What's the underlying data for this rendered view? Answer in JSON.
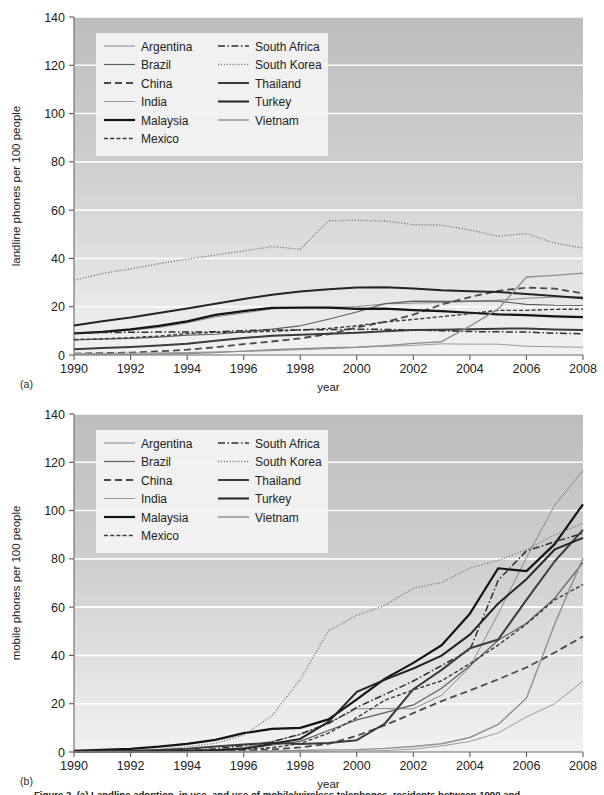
{
  "figure": {
    "panel_a_tag": "(a)",
    "panel_b_tag": "(b)",
    "caption": "Figure 2.  (a) Landline adoption, in use, and use of mobile/wireless telephones, residents between 1990 and"
  },
  "legend": {
    "entries": [
      {
        "label": "Argentina",
        "style": "solid",
        "width": 1.0,
        "color": "#8a8a8a"
      },
      {
        "label": "Brazil",
        "style": "solid",
        "width": 1.2,
        "color": "#5e5e5e"
      },
      {
        "label": "China",
        "style": "dashed",
        "width": 1.8,
        "color": "#4a4a4a"
      },
      {
        "label": "India",
        "style": "solid",
        "width": 1.0,
        "color": "#9a9a9a"
      },
      {
        "label": "Malaysia",
        "style": "solid",
        "width": 2.2,
        "color": "#141414"
      },
      {
        "label": "Mexico",
        "style": "dotted-dash",
        "width": 1.4,
        "color": "#3a3a3a"
      },
      {
        "label": "South Africa",
        "style": "dashdot",
        "width": 1.5,
        "color": "#2e2e2e"
      },
      {
        "label": "South Korea",
        "style": "dotted",
        "width": 1.3,
        "color": "#7a7a7a"
      },
      {
        "label": "Thailand",
        "style": "solid",
        "width": 2.0,
        "color": "#3b3b3b"
      },
      {
        "label": "Turkey",
        "style": "solid",
        "width": 2.0,
        "color": "#242424"
      },
      {
        "label": "Vietnam",
        "style": "solid",
        "width": 1.4,
        "color": "#8f8f8f"
      }
    ]
  },
  "chart_data": [
    {
      "type": "line",
      "panel": "a",
      "title": "",
      "xlabel": "year",
      "ylabel": "landline phones per 100 people",
      "xlim": [
        1990,
        2008
      ],
      "ylim": [
        0,
        140
      ],
      "xticks": [
        1990,
        1992,
        1994,
        1996,
        1998,
        2000,
        2002,
        2004,
        2006,
        2008
      ],
      "yticks": [
        0,
        20,
        40,
        60,
        80,
        100,
        120,
        140
      ],
      "grid": "horizontal-white",
      "legend_position": "upper-left-inside",
      "x": [
        1990,
        1991,
        1992,
        1993,
        1994,
        1995,
        1996,
        1997,
        1998,
        1999,
        2000,
        2001,
        2002,
        2003,
        2004,
        2005,
        2006,
        2007,
        2008
      ],
      "series": [
        {
          "name": "Argentina",
          "values": [
            9.3,
            9.6,
            10.3,
            11.4,
            13.3,
            15.8,
            17.4,
            19.1,
            19.7,
            19.8,
            20.0,
            21.2,
            21.5,
            21.7,
            22.2,
            22.7,
            23.5,
            24.0,
            24.2
          ]
        },
        {
          "name": "Brazil",
          "values": [
            6.3,
            6.6,
            6.9,
            7.4,
            8.2,
            8.6,
            9.6,
            10.7,
            12.1,
            14.8,
            17.8,
            21.3,
            22.3,
            22.2,
            22.3,
            22.3,
            21.0,
            20.6,
            20.5
          ]
        },
        {
          "name": "China",
          "values": [
            0.6,
            0.8,
            1.0,
            1.5,
            2.2,
            3.2,
            4.5,
            5.6,
            6.9,
            8.6,
            11.4,
            13.7,
            16.7,
            20.9,
            24.0,
            26.6,
            27.9,
            27.5,
            25.5
          ]
        },
        {
          "name": "India",
          "values": [
            0.6,
            0.7,
            0.8,
            0.9,
            1.0,
            1.3,
            1.5,
            1.8,
            2.2,
            2.6,
            3.2,
            3.6,
            4.0,
            4.6,
            4.5,
            4.5,
            3.6,
            3.4,
            3.2
          ]
        },
        {
          "name": "Malaysia",
          "values": [
            8.9,
            9.6,
            10.6,
            12.1,
            13.9,
            16.6,
            18.2,
            19.5,
            19.6,
            19.6,
            19.1,
            19.2,
            18.6,
            18.2,
            17.5,
            16.8,
            16.5,
            16.0,
            15.7
          ]
        },
        {
          "name": "Mexico",
          "values": [
            6.4,
            6.7,
            7.2,
            7.8,
            8.9,
            9.4,
            9.4,
            9.8,
            10.4,
            11.0,
            12.1,
            13.7,
            14.7,
            15.9,
            17.1,
            18.5,
            18.5,
            18.9,
            19.0
          ]
        },
        {
          "name": "South Africa",
          "values": [
            9.0,
            9.3,
            9.4,
            9.5,
            9.5,
            9.6,
            10.1,
            10.4,
            10.4,
            10.5,
            10.7,
            10.6,
            10.4,
            10.0,
            9.7,
            9.6,
            9.5,
            9.0,
            8.8
          ]
        },
        {
          "name": "South Korea",
          "values": [
            31.0,
            33.7,
            35.7,
            37.8,
            39.7,
            41.4,
            43.1,
            44.9,
            43.8,
            55.6,
            55.8,
            55.5,
            54.0,
            53.8,
            51.8,
            49.2,
            50.3,
            46.3,
            44.3
          ]
        },
        {
          "name": "Thailand",
          "values": [
            2.4,
            2.9,
            3.3,
            3.9,
            4.7,
            5.9,
            7.0,
            8.0,
            8.4,
            8.8,
            9.2,
            9.8,
            10.4,
            10.5,
            10.7,
            10.9,
            11.0,
            10.6,
            10.4
          ]
        },
        {
          "name": "Turkey",
          "values": [
            12.2,
            14.0,
            15.5,
            17.4,
            19.3,
            21.2,
            23.2,
            25.0,
            26.3,
            27.2,
            28.0,
            28.1,
            27.5,
            26.8,
            26.4,
            26.1,
            25.3,
            24.4,
            23.5
          ]
        },
        {
          "name": "Vietnam",
          "values": [
            0.15,
            0.2,
            0.25,
            0.4,
            0.6,
            1.0,
            1.6,
            2.2,
            2.6,
            3.0,
            3.2,
            3.9,
            4.8,
            5.5,
            12.0,
            19.0,
            32.3,
            33.0,
            33.9
          ]
        }
      ]
    },
    {
      "type": "line",
      "panel": "b",
      "title": "",
      "xlabel": "year",
      "ylabel": "mobile phones per 100 people",
      "xlim": [
        1990,
        2008
      ],
      "ylim": [
        0,
        140
      ],
      "xticks": [
        1990,
        1992,
        1994,
        1996,
        1998,
        2000,
        2002,
        2004,
        2006,
        2008
      ],
      "yticks": [
        0,
        20,
        40,
        60,
        80,
        100,
        120,
        140
      ],
      "grid": "horizontal-white",
      "legend_position": "upper-left-inside",
      "x": [
        1990,
        1991,
        1992,
        1993,
        1994,
        1995,
        1996,
        1997,
        1998,
        1999,
        2000,
        2001,
        2002,
        2003,
        2004,
        2005,
        2006,
        2007,
        2008
      ],
      "series": [
        {
          "name": "Argentina",
          "values": [
            0.0,
            0.1,
            0.2,
            0.4,
            0.8,
            1.0,
            1.8,
            4.3,
            7.2,
            12.0,
            17.9,
            18.0,
            17.9,
            23.5,
            35.2,
            57.3,
            80.5,
            102.2,
            116.6
          ]
        },
        {
          "name": "Brazil",
          "values": [
            0.0,
            0.0,
            0.1,
            0.2,
            0.4,
            0.8,
            1.6,
            2.8,
            4.4,
            8.9,
            13.3,
            16.3,
            19.5,
            26.4,
            35.7,
            46.3,
            53.3,
            63.7,
            78.5
          ]
        },
        {
          "name": "China",
          "values": [
            0.0,
            0.0,
            0.0,
            0.1,
            0.1,
            0.3,
            0.6,
            1.1,
            1.9,
            3.4,
            6.7,
            11.1,
            16.1,
            21.1,
            25.5,
            30.1,
            35.0,
            41.2,
            47.9
          ]
        },
        {
          "name": "India",
          "values": [
            0.0,
            0.0,
            0.0,
            0.0,
            0.0,
            0.0,
            0.0,
            0.1,
            0.1,
            0.2,
            0.4,
            0.6,
            1.2,
            2.5,
            4.4,
            7.9,
            14.5,
            20.0,
            29.4
          ]
        },
        {
          "name": "Malaysia",
          "values": [
            0.5,
            0.9,
            1.3,
            2.2,
            3.4,
            5.0,
            7.8,
            9.6,
            10.0,
            13.5,
            21.8,
            30.4,
            36.9,
            44.2,
            57.3,
            76.1,
            74.9,
            86.1,
            102.6
          ]
        },
        {
          "name": "Mexico",
          "values": [
            0.1,
            0.2,
            0.3,
            0.5,
            0.6,
            0.7,
            1.1,
            1.8,
            3.5,
            7.8,
            14.2,
            21.5,
            25.7,
            29.5,
            36.6,
            44.3,
            53.0,
            63.0,
            69.4
          ]
        },
        {
          "name": "South Africa",
          "values": [
            0.0,
            0.0,
            0.0,
            0.2,
            0.6,
            1.3,
            2.6,
            4.2,
            7.4,
            11.8,
            18.5,
            23.9,
            29.4,
            35.8,
            42.3,
            71.1,
            83.3,
            87.1,
            90.6
          ]
        },
        {
          "name": "South Korea",
          "values": [
            0.2,
            0.4,
            0.6,
            1.1,
            2.2,
            3.6,
            7.0,
            15.0,
            30.0,
            50.2,
            56.6,
            60.8,
            67.9,
            70.2,
            76.2,
            79.4,
            83.8,
            89.9,
            94.7
          ]
        },
        {
          "name": "Thailand",
          "values": [
            0.1,
            0.2,
            0.4,
            0.8,
            1.3,
            2.3,
            3.1,
            3.8,
            3.3,
            3.7,
            4.9,
            11.8,
            26.0,
            34.0,
            43.0,
            46.6,
            63.0,
            79.0,
            92.0
          ]
        },
        {
          "name": "Turkey",
          "values": [
            0.0,
            0.1,
            0.1,
            0.2,
            0.4,
            0.7,
            1.3,
            3.4,
            5.4,
            12.5,
            24.9,
            30.0,
            34.6,
            39.9,
            48.6,
            61.5,
            71.6,
            83.9,
            88.7
          ]
        },
        {
          "name": "Vietnam",
          "values": [
            0.0,
            0.0,
            0.0,
            0.0,
            0.0,
            0.1,
            0.2,
            0.4,
            0.6,
            0.9,
            1.0,
            1.5,
            2.3,
            3.4,
            6.0,
            11.4,
            22.3,
            53.0,
            80.4
          ]
        }
      ]
    }
  ]
}
